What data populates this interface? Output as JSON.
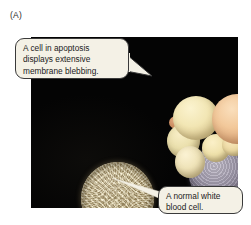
{
  "figure": {
    "panel_label": "(A)",
    "background_color": "#ffffff",
    "plate_color": "#060606"
  },
  "callouts": [
    {
      "id": "callout-apoptosis",
      "text": "A  cell in apoptosis\ndisplays extensive\nmembrane blebbing.",
      "points_to": "apoptotic-cell",
      "fill_color": "#f4f1e6",
      "border_color": "#3a3a3a"
    },
    {
      "id": "callout-normal",
      "text": "A normal white\nblood cell.",
      "points_to": "normal-white-blood-cell",
      "fill_color": "#f4f1e6",
      "border_color": "#3a3a3a"
    }
  ],
  "specimens": [
    {
      "id": "apoptotic-cell",
      "name": "Cell in apoptosis with membrane blebbing",
      "bleb_count": 7,
      "bleb_color": "#f2e6b4",
      "body_color": "#a9a3b4"
    },
    {
      "id": "normal-white-blood-cell",
      "name": "Normal white blood cell",
      "surface": "microvilli",
      "color": "#ded0a8"
    }
  ]
}
